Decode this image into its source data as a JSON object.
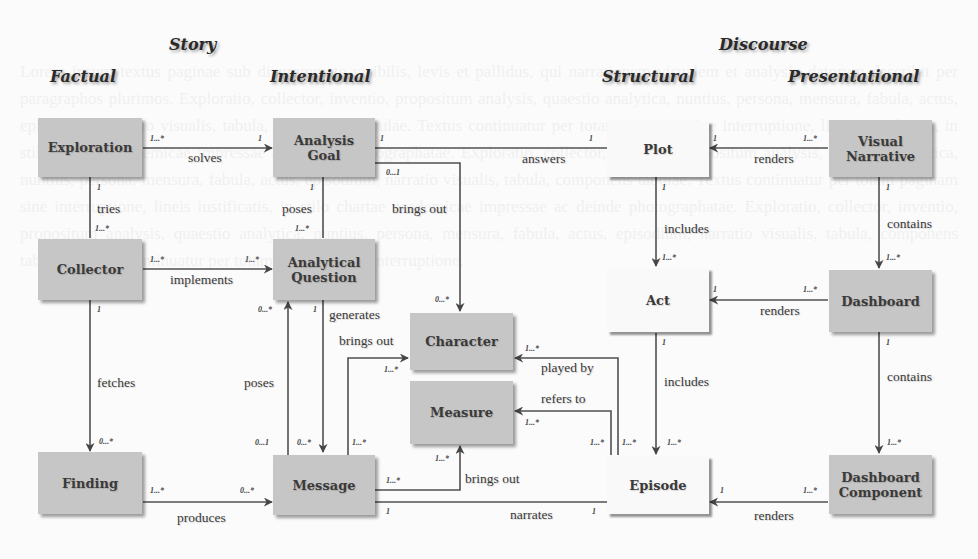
{
  "headings": {
    "story": "Story",
    "discourse": "Discourse",
    "factual": "Factual",
    "intentional": "Intentional",
    "structural": "Structural",
    "presentational": "Presentational"
  },
  "entities": {
    "exploration": "Exploration",
    "collector": "Collector",
    "finding": "Finding",
    "analysis_goal": "Analysis Goal",
    "analytical_question": "Analytical Question",
    "message": "Message",
    "character": "Character",
    "measure": "Measure",
    "plot": "Plot",
    "act": "Act",
    "episode": "Episode",
    "visual_narrative": "Visual Narrative",
    "dashboard": "Dashboard",
    "dashboard_component": "Dashboard Component"
  },
  "relations": {
    "solves": "solves",
    "tries": "tries",
    "implements": "implements",
    "fetches": "fetches",
    "produces": "produces",
    "poses_goal": "poses",
    "poses_message": "poses",
    "brings_out_goal": "brings out",
    "generates": "generates",
    "brings_out_question": "brings out",
    "brings_out_message": "brings out",
    "answers": "answers",
    "narrates": "narrates",
    "played_by": "played by",
    "refers_to": "refers to",
    "includes_plot": "includes",
    "includes_act": "includes",
    "renders_plot": "renders",
    "renders_act": "renders",
    "renders_episode": "renders",
    "contains_vn": "contains",
    "contains_db": "contains"
  },
  "multiplicities": {
    "one": "1",
    "one_many": "1...*",
    "zero_many": "0...*",
    "zero_one": "0...1"
  },
  "colors": {
    "story_box": "#c6c6c6",
    "discourse_structural_box": "#f9f9f9",
    "line": "#505050",
    "text": "#3a3a3a"
  }
}
